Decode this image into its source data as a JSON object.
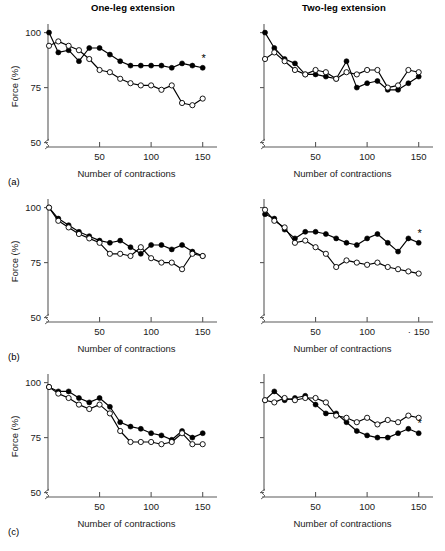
{
  "figure": {
    "column_titles": [
      "One-leg extension",
      "Two-leg extension"
    ],
    "row_labels": [
      "(a)",
      "(b)",
      "(c)"
    ],
    "xlabel": "Number of contractions",
    "ylabel": "Force (%)",
    "significance_marker": "*",
    "y_ticks": [
      50,
      75,
      100
    ],
    "x_ticks": [
      50,
      100,
      150
    ],
    "x_tick_labels": [
      "50",
      "100",
      "150"
    ],
    "y_tick_labels": [
      "50",
      "75",
      "100"
    ],
    "x_tick_labels_b_right": [
      "50",
      "100",
      "· 150"
    ],
    "axis_break": true,
    "colors": {
      "line": "#000000",
      "axis": "#5a5a5a",
      "open_marker_fill": "#ffffff",
      "filled_marker_fill": "#000000",
      "background": "#ffffff"
    },
    "legend": {
      "filled_series": "closed circles",
      "open_series": "open circles"
    }
  },
  "chart_data": [
    {
      "id": "a-left",
      "type": "line",
      "title": "One-leg extension",
      "panel": "(a)",
      "xlabel": "Number of contractions",
      "ylabel": "Force (%)",
      "xlim": [
        0,
        160
      ],
      "ylim": [
        48,
        103
      ],
      "grid": false,
      "legend_position": "none",
      "annotations": [
        "*"
      ],
      "x": [
        1,
        10,
        20,
        30,
        40,
        50,
        60,
        70,
        80,
        90,
        100,
        110,
        120,
        130,
        140,
        150
      ],
      "series": [
        {
          "name": "closed circles",
          "marker": "filled",
          "values": [
            100,
            91,
            92,
            87,
            93,
            93,
            90,
            87,
            85,
            85,
            85,
            85,
            84,
            86,
            85,
            84
          ]
        },
        {
          "name": "open circles",
          "marker": "open",
          "values": [
            94,
            96,
            94,
            92,
            88,
            83,
            82,
            79,
            77,
            76,
            76,
            74,
            76,
            68,
            67,
            70
          ]
        }
      ]
    },
    {
      "id": "a-right",
      "type": "line",
      "title": "Two-leg extension",
      "panel": "(a)",
      "xlabel": "Number of contractions",
      "ylabel": "Force (%)",
      "xlim": [
        0,
        160
      ],
      "ylim": [
        48,
        103
      ],
      "grid": false,
      "legend_position": "none",
      "annotations": [],
      "x": [
        1,
        10,
        20,
        30,
        40,
        50,
        60,
        70,
        80,
        90,
        100,
        110,
        120,
        130,
        140,
        150
      ],
      "series": [
        {
          "name": "closed circles",
          "marker": "filled",
          "values": [
            100,
            93,
            88,
            86,
            81,
            81,
            80,
            79,
            87,
            75,
            77,
            78,
            74,
            74,
            77,
            80
          ]
        },
        {
          "name": "open circles",
          "marker": "open",
          "values": [
            88,
            91,
            87,
            83,
            81,
            83,
            82,
            79,
            82,
            81,
            83,
            83,
            75,
            76,
            83,
            82
          ]
        }
      ]
    },
    {
      "id": "b-left",
      "type": "line",
      "title": "One-leg extension",
      "panel": "(b)",
      "xlabel": "Number of contractions",
      "ylabel": "Force (%)",
      "xlim": [
        0,
        160
      ],
      "ylim": [
        48,
        103
      ],
      "grid": false,
      "legend_position": "none",
      "annotations": [],
      "x": [
        1,
        10,
        20,
        30,
        40,
        50,
        60,
        70,
        80,
        90,
        100,
        110,
        120,
        130,
        140,
        150
      ],
      "series": [
        {
          "name": "closed circles",
          "marker": "filled",
          "values": [
            100,
            95,
            92,
            89,
            87,
            85,
            84,
            85,
            82,
            79,
            83,
            83,
            81,
            83,
            80,
            78
          ]
        },
        {
          "name": "open circles",
          "marker": "open",
          "values": [
            100,
            94,
            91,
            88,
            86,
            84,
            79,
            79,
            78,
            82,
            77,
            75,
            75,
            72,
            79,
            78
          ]
        }
      ]
    },
    {
      "id": "b-right",
      "type": "line",
      "title": "Two-leg extension",
      "panel": "(b)",
      "xlabel": "Number of contractions",
      "ylabel": "Force (%)",
      "xlim": [
        0,
        160
      ],
      "ylim": [
        48,
        103
      ],
      "grid": false,
      "legend_position": "none",
      "annotations": [
        "*"
      ],
      "x": [
        1,
        10,
        20,
        30,
        40,
        50,
        60,
        70,
        80,
        90,
        100,
        110,
        120,
        130,
        140,
        150
      ],
      "series": [
        {
          "name": "closed circles",
          "marker": "filled",
          "values": [
            97,
            95,
            90,
            86,
            89,
            89,
            88,
            86,
            84,
            83,
            86,
            88,
            84,
            80,
            86,
            84
          ]
        },
        {
          "name": "open circles",
          "marker": "open",
          "values": [
            99,
            94,
            91,
            84,
            85,
            82,
            79,
            73,
            76,
            75,
            74,
            75,
            73,
            72,
            71,
            70
          ]
        }
      ]
    },
    {
      "id": "c-left",
      "type": "line",
      "title": "One-leg extension",
      "panel": "(c)",
      "xlabel": "Number of contractions",
      "ylabel": "Force (%)",
      "xlim": [
        0,
        160
      ],
      "ylim": [
        48,
        103
      ],
      "grid": false,
      "legend_position": "none",
      "annotations": [],
      "x": [
        1,
        10,
        20,
        30,
        40,
        50,
        60,
        70,
        80,
        90,
        100,
        110,
        120,
        130,
        140,
        150
      ],
      "series": [
        {
          "name": "closed circles",
          "marker": "filled",
          "values": [
            98,
            96,
            96,
            93,
            91,
            93,
            89,
            82,
            80,
            79,
            77,
            76,
            74,
            78,
            75,
            77
          ]
        },
        {
          "name": "open circles",
          "marker": "open",
          "values": [
            98,
            95,
            93,
            90,
            88,
            90,
            86,
            78,
            73,
            73,
            73,
            72,
            73,
            77,
            72,
            72
          ]
        }
      ]
    },
    {
      "id": "c-right",
      "type": "line",
      "title": "Two-leg extension",
      "panel": "(c)",
      "xlabel": "Number of contractions",
      "ylabel": "Force (%)",
      "xlim": [
        0,
        160
      ],
      "ylim": [
        48,
        103
      ],
      "grid": false,
      "legend_position": "none",
      "annotations": [
        "*"
      ],
      "x": [
        1,
        10,
        20,
        30,
        40,
        50,
        60,
        70,
        80,
        90,
        100,
        110,
        120,
        130,
        140,
        150
      ],
      "series": [
        {
          "name": "closed circles",
          "marker": "filled",
          "values": [
            92,
            96,
            92,
            93,
            94,
            90,
            86,
            86,
            82,
            78,
            76,
            75,
            75,
            77,
            79,
            77
          ]
        },
        {
          "name": "open circles",
          "marker": "open",
          "values": [
            92,
            91,
            93,
            92,
            93,
            93,
            91,
            85,
            84,
            82,
            84,
            81,
            83,
            82,
            85,
            84
          ]
        }
      ]
    }
  ]
}
